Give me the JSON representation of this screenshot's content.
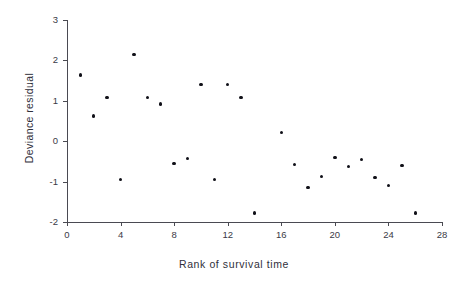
{
  "chart_data": {
    "type": "scatter",
    "title": "",
    "xlabel": "Rank of survival time",
    "ylabel": "Deviance residual",
    "xlim": [
      0,
      28
    ],
    "ylim": [
      -2,
      3
    ],
    "xticks": [
      0,
      4,
      8,
      12,
      16,
      20,
      24,
      28
    ],
    "xticklabels": [
      "0",
      "4",
      "8",
      "12",
      "16",
      "20",
      "24",
      "28"
    ],
    "yticks": [
      -2,
      -1,
      0,
      1,
      2,
      3
    ],
    "yticklabels": [
      "-2",
      "-1",
      "0",
      "1",
      "2",
      "3"
    ],
    "grid": false,
    "legend": null,
    "marker": "filled-circle",
    "marker_color": "#101018",
    "axis_color": "#4a4a52",
    "background": "#ffffff",
    "n_points": 26,
    "x": [
      1,
      2,
      3,
      4,
      5,
      6,
      7,
      8,
      9,
      10,
      11,
      12,
      13,
      14,
      16,
      17,
      18,
      19,
      20,
      21,
      22,
      23,
      24,
      25,
      26
    ],
    "y": [
      1.64,
      0.62,
      1.08,
      -0.95,
      2.15,
      1.08,
      0.92,
      -0.55,
      -0.43,
      1.4,
      -0.95,
      1.4,
      1.08,
      -1.78,
      0.22,
      -0.57,
      -1.15,
      -0.88,
      -0.4,
      -0.62,
      -0.45,
      -0.9,
      -1.1,
      -0.6,
      -1.78
    ],
    "points": [
      {
        "x": 1,
        "y": 1.64
      },
      {
        "x": 2,
        "y": 0.62
      },
      {
        "x": 3,
        "y": 1.08
      },
      {
        "x": 4,
        "y": -0.95
      },
      {
        "x": 5,
        "y": 2.15
      },
      {
        "x": 6,
        "y": 1.08
      },
      {
        "x": 7,
        "y": 0.92
      },
      {
        "x": 8,
        "y": -0.55
      },
      {
        "x": 9,
        "y": -0.43
      },
      {
        "x": 10,
        "y": 1.4
      },
      {
        "x": 11,
        "y": -0.95
      },
      {
        "x": 12,
        "y": 1.4
      },
      {
        "x": 13,
        "y": 1.08
      },
      {
        "x": 14,
        "y": -1.78
      },
      {
        "x": 16,
        "y": 0.22
      },
      {
        "x": 17,
        "y": -0.57
      },
      {
        "x": 18,
        "y": -1.15
      },
      {
        "x": 19,
        "y": -0.88
      },
      {
        "x": 20,
        "y": -0.4
      },
      {
        "x": 21,
        "y": -0.62
      },
      {
        "x": 22,
        "y": -0.45
      },
      {
        "x": 23,
        "y": -0.9
      },
      {
        "x": 24,
        "y": -1.1
      },
      {
        "x": 25,
        "y": -0.6
      },
      {
        "x": 26,
        "y": -1.78
      }
    ]
  }
}
